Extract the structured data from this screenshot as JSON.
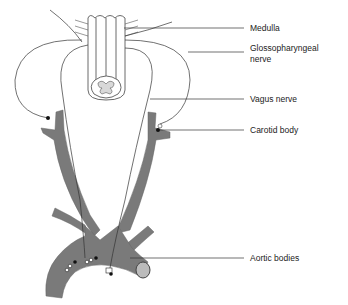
{
  "diagram": {
    "labels": [
      {
        "id": "medulla",
        "text": "Medulla",
        "y": 24
      },
      {
        "id": "glossopharyngeal",
        "text": "Glossopharyngeal",
        "text2": "nerve",
        "y": 44
      },
      {
        "id": "vagus",
        "text": "Vagus nerve",
        "y": 95
      },
      {
        "id": "carotid",
        "text": "Carotid body",
        "y": 126
      },
      {
        "id": "aortic",
        "text": "Aortic bodies",
        "y": 254
      }
    ],
    "colors": {
      "vessel_fill": "#7a7a7a",
      "line": "#333333",
      "background": "#ffffff",
      "medulla_fill": "#ffffff",
      "gray_matter": "#d8d8d8"
    }
  }
}
